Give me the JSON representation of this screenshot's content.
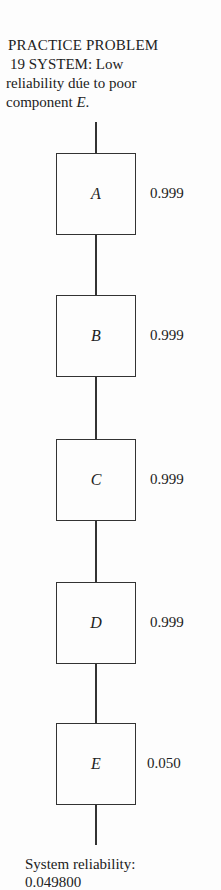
{
  "title": {
    "line1": "PRACTICE PROBLEM",
    "line2": "19 SYSTEM:  Low",
    "line3": "reliability dúe to poor",
    "line4_prefix": "component ",
    "line4_var": "E",
    "line4_suffix": "."
  },
  "components": [
    {
      "label": "A",
      "reliability": "0.999"
    },
    {
      "label": "B",
      "reliability": "0.999"
    },
    {
      "label": "C",
      "reliability": "0.999"
    },
    {
      "label": "D",
      "reliability": "0.999"
    },
    {
      "label": "E",
      "reliability": "0.050"
    }
  ],
  "footer": {
    "label": "System reliability:",
    "value": "0.049800"
  }
}
